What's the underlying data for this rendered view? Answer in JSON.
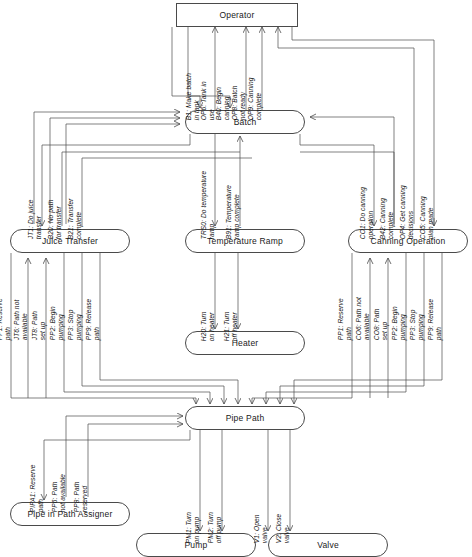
{
  "diagram": {
    "nodes": [
      {
        "id": "operator",
        "label": "Operator",
        "shape": "rect",
        "x": 176,
        "y": 3,
        "w": 122,
        "h": 24
      },
      {
        "id": "batch",
        "label": "Batch",
        "shape": "rounded",
        "x": 185,
        "y": 110,
        "w": 120,
        "h": 24
      },
      {
        "id": "juice-transfer",
        "label": "Juice Transfer",
        "shape": "rounded",
        "x": 10,
        "y": 229,
        "w": 120,
        "h": 24
      },
      {
        "id": "temperature-ramp",
        "label": "Temperature Ramp",
        "shape": "rounded",
        "x": 185,
        "y": 229,
        "w": 120,
        "h": 24
      },
      {
        "id": "canning-operation",
        "label": "Canning Operation",
        "shape": "rounded",
        "x": 348,
        "y": 229,
        "w": 120,
        "h": 24
      },
      {
        "id": "heater",
        "label": "Heater",
        "shape": "rounded",
        "x": 185,
        "y": 331,
        "w": 120,
        "h": 24
      },
      {
        "id": "pipe-path",
        "label": "Pipe Path",
        "shape": "rounded",
        "x": 185,
        "y": 406,
        "w": 120,
        "h": 24
      },
      {
        "id": "pipe-in-path-assigner",
        "label": "Pipe in Path Assigner",
        "shape": "rounded",
        "x": 10,
        "y": 502,
        "w": 120,
        "h": 24
      },
      {
        "id": "pump",
        "label": "Pump",
        "shape": "rounded",
        "x": 136,
        "y": 533,
        "w": 120,
        "h": 24
      },
      {
        "id": "valve",
        "label": "Valve",
        "shape": "rounded",
        "x": 268,
        "y": 533,
        "w": 120,
        "h": 24
      }
    ],
    "messages": [
      {
        "id": "b1",
        "line1": "B1: Make batch",
        "line2": "in tank",
        "x": 200,
        "y": 105,
        "from": "operator",
        "to": "batch"
      },
      {
        "id": "op6",
        "line1": "OP6: Tank in",
        "line2": "use",
        "x": 215,
        "y": 105,
        "from": "batch",
        "to": "operator"
      },
      {
        "id": "b40",
        "line1": "B40: Begin",
        "line2": "canning",
        "x": 230,
        "y": 105,
        "from": "operator",
        "to": "batch"
      },
      {
        "id": "op8",
        "line1": "OP8: Batch",
        "line2": "not ready",
        "x": 246,
        "y": 105,
        "from": "batch",
        "to": "operator"
      },
      {
        "id": "op9",
        "line1": "OP9: Canning",
        "line2": "complete",
        "x": 262,
        "y": 105,
        "from": "batch",
        "to": "operator"
      },
      {
        "id": "jt1",
        "line1": "JT1: Do juice",
        "line2": "transfer",
        "x": 42,
        "y": 224,
        "from": "batch",
        "to": "juice-transfer"
      },
      {
        "id": "b20",
        "line1": "B20: No path",
        "line2": "for transfer",
        "x": 62,
        "y": 224,
        "from": "juice-transfer",
        "to": "batch"
      },
      {
        "id": "b21",
        "line1": "B21: Transfer",
        "line2": "complete",
        "x": 82,
        "y": 224,
        "from": "juice-transfer",
        "to": "batch"
      },
      {
        "id": "trs0",
        "line1": "TRS0: Do temperature",
        "line2": "ramp",
        "x": 215,
        "y": 224,
        "from": "batch",
        "to": "temperature-ramp"
      },
      {
        "id": "b91",
        "line1": "B91: Temperature",
        "line2": "ramp complete",
        "x": 240,
        "y": 224,
        "from": "temperature-ramp",
        "to": "batch"
      },
      {
        "id": "co1",
        "line1": "CO1: Do canning",
        "line2": "operation",
        "x": 374,
        "y": 224,
        "from": "batch",
        "to": "canning-operation"
      },
      {
        "id": "b42",
        "line1": "B42: Canning",
        "line2": "complete",
        "x": 394,
        "y": 224,
        "from": "canning-operation",
        "to": "batch"
      },
      {
        "id": "op4",
        "line1": "OP4: Get canning",
        "line2": "decisions",
        "x": 414,
        "y": 224,
        "from": "canning-operation",
        "to": "operator"
      },
      {
        "id": "co5",
        "line1": "CO5: Canning",
        "line2": "plan made",
        "x": 434,
        "y": 224,
        "from": "operator",
        "to": "canning-operation"
      },
      {
        "id": "jt-pp1",
        "line1": "PP1: Reserve",
        "line2": "path",
        "x": 11,
        "y": 325,
        "from": "juice-transfer",
        "to": "pipe-path"
      },
      {
        "id": "jt6",
        "line1": "JT6: Path not",
        "line2": "available",
        "x": 28,
        "y": 325,
        "from": "pipe-path",
        "to": "juice-transfer"
      },
      {
        "id": "jt8",
        "line1": "JT8: Path",
        "line2": "set up",
        "x": 46,
        "y": 325,
        "from": "pipe-path",
        "to": "juice-transfer"
      },
      {
        "id": "jt-pp2",
        "line1": "PP2: Begin",
        "line2": "pumping",
        "x": 64,
        "y": 325,
        "from": "juice-transfer",
        "to": "pipe-path"
      },
      {
        "id": "jt-pp3",
        "line1": "PP3: Stop",
        "line2": "pumping",
        "x": 82,
        "y": 325,
        "from": "juice-transfer",
        "to": "pipe-path"
      },
      {
        "id": "jt-pp9",
        "line1": "PP9: Release",
        "line2": "path",
        "x": 100,
        "y": 325,
        "from": "juice-transfer",
        "to": "pipe-path"
      },
      {
        "id": "h20",
        "line1": "H20: Turn",
        "line2": "on heater",
        "x": 215,
        "y": 326,
        "from": "temperature-ramp",
        "to": "heater"
      },
      {
        "id": "h21",
        "line1": "H21: Turn",
        "line2": "off heater",
        "x": 238,
        "y": 326,
        "from": "temperature-ramp",
        "to": "heater"
      },
      {
        "id": "co-pp1",
        "line1": "PP1: Reserve",
        "line2": "path",
        "x": 352,
        "y": 325,
        "from": "canning-operation",
        "to": "pipe-path"
      },
      {
        "id": "co6",
        "line1": "CO6: Path not",
        "line2": "available",
        "x": 370,
        "y": 325,
        "from": "pipe-path",
        "to": "canning-operation"
      },
      {
        "id": "co8",
        "line1": "CO8: Path",
        "line2": "set up",
        "x": 388,
        "y": 325,
        "from": "pipe-path",
        "to": "canning-operation"
      },
      {
        "id": "co-pp2",
        "line1": "PP2: Begin",
        "line2": "pumping",
        "x": 406,
        "y": 325,
        "from": "canning-operation",
        "to": "pipe-path"
      },
      {
        "id": "co-pp3",
        "line1": "PP3: Stop",
        "line2": "pumping",
        "x": 424,
        "y": 325,
        "from": "canning-operation",
        "to": "pipe-path"
      },
      {
        "id": "co-pp9",
        "line1": "PP9: Release",
        "line2": "path",
        "x": 442,
        "y": 325,
        "from": "canning-operation",
        "to": "pipe-path"
      },
      {
        "id": "pipa1",
        "line1": "PIPA1: Reserve",
        "line2": "path",
        "x": 44,
        "y": 497,
        "from": "pipe-path",
        "to": "pipe-in-path-assigner"
      },
      {
        "id": "pp6",
        "line1": "PP6: Path",
        "line2": "not available",
        "x": 66,
        "y": 497,
        "from": "pipe-in-path-assigner",
        "to": "pipe-path"
      },
      {
        "id": "pp8",
        "line1": "PP8: Path",
        "line2": "reserved",
        "x": 88,
        "y": 497,
        "from": "pipe-in-path-assigner",
        "to": "pipe-path"
      },
      {
        "id": "pm1",
        "line1": "PM1: Turn",
        "line2": "on pump",
        "x": 200,
        "y": 528,
        "from": "pipe-path",
        "to": "pump"
      },
      {
        "id": "pm2",
        "line1": "PM2: Turn",
        "line2": "off pump",
        "x": 222,
        "y": 528,
        "from": "pipe-path",
        "to": "pump"
      },
      {
        "id": "v1",
        "line1": "V1: Open",
        "line2": "valve",
        "x": 268,
        "y": 528,
        "from": "pipe-path",
        "to": "valve"
      },
      {
        "id": "v2",
        "line1": "V2: Close",
        "line2": "valve",
        "x": 290,
        "y": 528,
        "from": "pipe-path",
        "to": "valve"
      }
    ],
    "colors": {
      "stroke": "#4a4a4a",
      "text": "#1a1a1a",
      "background": "#ffffff"
    }
  }
}
